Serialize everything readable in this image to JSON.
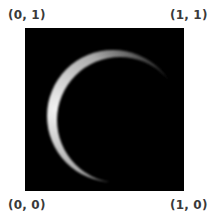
{
  "corner_labels": {
    "top_left": "(0, 1)",
    "top_right": "(1, 1)",
    "bottom_left": "(0, 0)",
    "bottom_right": "(1, 0)"
  },
  "image": {
    "subject": "crescent-moon",
    "background_color": "#000000",
    "crescent_color": "#e8e8e8",
    "lit_side": "left"
  }
}
